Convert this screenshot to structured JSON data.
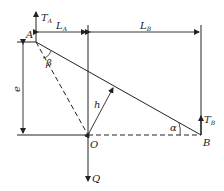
{
  "diagram": {
    "points": {
      "A": "A",
      "O": "O",
      "B": "B"
    },
    "forces": {
      "TA": "T",
      "TA_sub": "A",
      "TB": "T",
      "TB_sub": "B",
      "Q": "Q"
    },
    "dimensions": {
      "LA": "L",
      "LA_sub": "A",
      "LB": "L",
      "LB_sub": "B",
      "e": "e",
      "h": "h"
    },
    "angles": {
      "alpha": "α",
      "beta": "β"
    }
  }
}
